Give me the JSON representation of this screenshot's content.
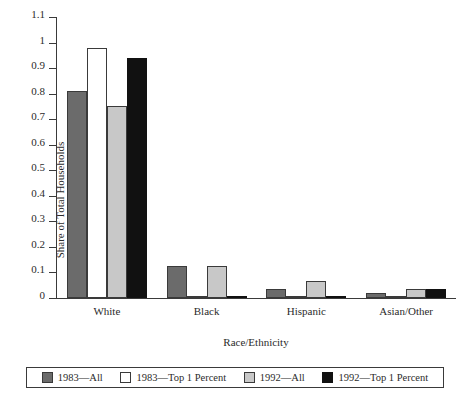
{
  "chart_data": {
    "type": "bar",
    "title": "",
    "xlabel": "Race/Ethnicity",
    "ylabel": "Share of Total Households",
    "categories": [
      "White",
      "Black",
      "Hispanic",
      "Asian/Other"
    ],
    "series": [
      {
        "name": "1983—All",
        "color": "#6b6b6b",
        "values": [
          0.81,
          0.125,
          0.035,
          0.02
        ]
      },
      {
        "name": "1983—Top 1 Percent",
        "color": "#ffffff",
        "values": [
          0.98,
          0.004,
          0.002,
          0.003
        ]
      },
      {
        "name": "1992—All",
        "color": "#c8c8c8",
        "values": [
          0.75,
          0.125,
          0.065,
          0.035
        ]
      },
      {
        "name": "1992—Top 1 Percent",
        "color": "#111111",
        "values": [
          0.94,
          0.003,
          0.008,
          0.035
        ]
      }
    ],
    "ylim": [
      0,
      1.1
    ],
    "ytick_labels": [
      "1.1",
      "1",
      "0.9",
      "0.8",
      "0.7",
      "0.6",
      "0.5",
      "0.4",
      "0.3",
      "0.2",
      "0.1",
      "0"
    ],
    "ytick_values": [
      1.1,
      1.0,
      0.9,
      0.8,
      0.7,
      0.6,
      0.5,
      0.4,
      0.3,
      0.2,
      0.1,
      0
    ],
    "grid": false,
    "legend_position": "bottom"
  }
}
